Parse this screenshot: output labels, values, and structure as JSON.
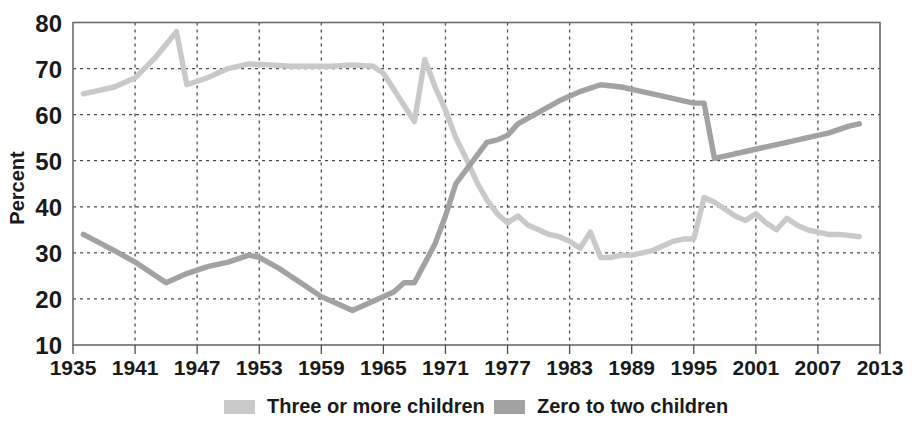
{
  "chart_data": {
    "type": "line",
    "title": "",
    "subtitle": "",
    "xlabel": "",
    "ylabel": "Percent",
    "xlim": [
      1935,
      2013
    ],
    "ylim": [
      10,
      80
    ],
    "ytick_values": [
      10,
      20,
      30,
      40,
      50,
      60,
      70,
      80
    ],
    "ytick_labels": [
      "10",
      "20",
      "30",
      "40",
      "50",
      "60",
      "70",
      "80"
    ],
    "xtick_values": [
      1935,
      1941,
      1947,
      1953,
      1959,
      1965,
      1971,
      1977,
      1983,
      1989,
      1995,
      2001,
      2007,
      2013
    ],
    "xtick_labels": [
      "1935",
      "1941",
      "1947",
      "1953",
      "1959",
      "1965",
      "1971",
      "1977",
      "1983",
      "1989",
      "1995",
      "2001",
      "2007",
      "2013"
    ],
    "grid": true,
    "legend_position": "bottom",
    "series": [
      {
        "name": "Three or more children",
        "color": "#c9c9c9",
        "x": [
          1936,
          1939,
          1941,
          1943,
          1945,
          1946,
          1948,
          1950,
          1952,
          1954,
          1956,
          1958,
          1960,
          1962,
          1964,
          1965,
          1966,
          1967,
          1968,
          1969,
          1970,
          1971,
          1972,
          1973,
          1974,
          1975,
          1976,
          1977,
          1978,
          1979,
          1980,
          1981,
          1982,
          1983,
          1984,
          1985,
          1986,
          1987,
          1988,
          1989,
          1990,
          1991,
          1992,
          1993,
          1994,
          1995,
          1996,
          1997,
          1998,
          1999,
          2000,
          2001,
          2002,
          2003,
          2004,
          2005,
          2006,
          2007,
          2008,
          2009,
          2010,
          2011
        ],
        "y": [
          64.5,
          66.0,
          68.0,
          72.5,
          78.0,
          66.5,
          68.0,
          70.0,
          71.0,
          70.8,
          70.5,
          70.5,
          70.5,
          70.8,
          70.5,
          69.0,
          65.5,
          62.0,
          58.5,
          72.0,
          66.0,
          61.0,
          55.0,
          50.5,
          45.5,
          41.5,
          38.5,
          36.5,
          38.0,
          36.0,
          35.0,
          34.0,
          33.5,
          32.5,
          31.0,
          34.5,
          29.0,
          29.0,
          29.5,
          29.5,
          30.0,
          30.5,
          31.5,
          32.5,
          33.0,
          33.0,
          42.0,
          41.0,
          39.5,
          38.0,
          37.0,
          38.5,
          36.5,
          35.0,
          37.5,
          36.0,
          35.0,
          34.5,
          34.0,
          34.0,
          33.8,
          33.5
        ]
      },
      {
        "name": "Zero to two children",
        "color": "#a2a2a2",
        "x": [
          1936,
          1939,
          1941,
          1944,
          1946,
          1948,
          1950,
          1952,
          1953,
          1955,
          1957,
          1959,
          1961,
          1962,
          1964,
          1966,
          1967,
          1968,
          1970,
          1971,
          1972,
          1973,
          1974,
          1975,
          1976,
          1977,
          1978,
          1980,
          1982,
          1984,
          1986,
          1988,
          1990,
          1992,
          1994,
          1995,
          1996,
          1997,
          1998,
          2000,
          2002,
          2004,
          2006,
          2008,
          2010,
          2011
        ],
        "y": [
          34.0,
          30.5,
          28.0,
          23.5,
          25.5,
          27.0,
          28.0,
          29.5,
          29.0,
          26.5,
          23.5,
          20.5,
          18.5,
          17.5,
          19.5,
          21.5,
          23.5,
          23.5,
          32.0,
          38.0,
          45.0,
          48.0,
          51.0,
          54.0,
          54.5,
          55.5,
          58.0,
          60.5,
          63.0,
          65.0,
          66.5,
          66.0,
          65.0,
          64.0,
          63.0,
          62.5,
          62.5,
          50.5,
          51.0,
          52.0,
          53.0,
          54.0,
          55.0,
          56.0,
          57.5,
          58.0
        ]
      }
    ],
    "legend": [
      {
        "label": "Three or more children",
        "color": "#c9c9c9"
      },
      {
        "label": "Zero to two children",
        "color": "#a2a2a2"
      }
    ]
  },
  "colors": {
    "three_or_more": "#c9c9c9",
    "zero_to_two": "#a2a2a2",
    "axis": "#6b6b6b",
    "grid": "#4d4d4d",
    "text": "#1a1a1a",
    "background": "#ffffff"
  }
}
